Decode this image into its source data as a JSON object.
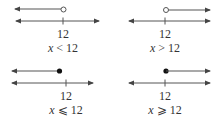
{
  "panels": [
    {
      "value": "12",
      "inequality_var": "x",
      "inequality_op": "<",
      "inequality_rhs": "12",
      "endpoint": "open",
      "direction": "left"
    },
    {
      "value": "12",
      "inequality_var": "x",
      "inequality_op": ">",
      "inequality_rhs": "12",
      "endpoint": "open",
      "direction": "right"
    },
    {
      "value": "12",
      "inequality_var": "x",
      "inequality_op": "⩽",
      "inequality_rhs": "12",
      "endpoint": "closed",
      "direction": "left"
    },
    {
      "value": "12",
      "inequality_var": "x",
      "inequality_op": "⩾",
      "inequality_rhs": "12",
      "endpoint": "closed",
      "direction": "right"
    }
  ],
  "colors": {
    "line": "#444444",
    "text": "#333333"
  }
}
